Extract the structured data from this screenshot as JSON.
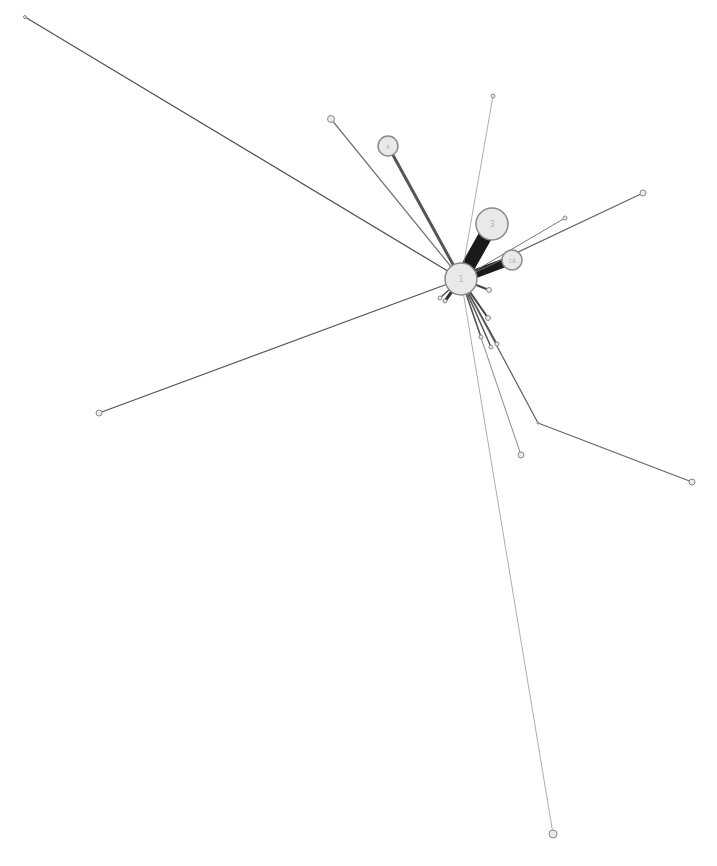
{
  "diagram": {
    "type": "network-graph",
    "background": "#ffffff",
    "node_fill": "#e9e9e9",
    "node_stroke": "#8a8a8a",
    "label_color": "#b5b5b5",
    "nodes": [
      {
        "id": "n1",
        "label": "1",
        "x": 461,
        "y": 279,
        "r": 16
      },
      {
        "id": "n3",
        "label": "3",
        "x": 492,
        "y": 224,
        "r": 16
      },
      {
        "id": "n4",
        "label": "4",
        "x": 388,
        "y": 146,
        "r": 10
      },
      {
        "id": "n18",
        "label": "18",
        "x": 512,
        "y": 260,
        "r": 10
      },
      {
        "id": "a",
        "label": "",
        "x": 25,
        "y": 17,
        "r": 1.5
      },
      {
        "id": "b",
        "label": "",
        "x": 331,
        "y": 119,
        "r": 3.5
      },
      {
        "id": "c",
        "label": "",
        "x": 493,
        "y": 96,
        "r": 2
      },
      {
        "id": "d",
        "label": "",
        "x": 643,
        "y": 193,
        "r": 3
      },
      {
        "id": "e",
        "label": "",
        "x": 565,
        "y": 218,
        "r": 2
      },
      {
        "id": "f",
        "label": "",
        "x": 99,
        "y": 413,
        "r": 3
      },
      {
        "id": "g",
        "label": "",
        "x": 538,
        "y": 423,
        "r": 1
      },
      {
        "id": "h",
        "label": "",
        "x": 692,
        "y": 482,
        "r": 3
      },
      {
        "id": "i",
        "label": "",
        "x": 521,
        "y": 455,
        "r": 3
      },
      {
        "id": "j",
        "label": "",
        "x": 553,
        "y": 834,
        "r": 4
      },
      {
        "id": "k",
        "label": "",
        "x": 445,
        "y": 301,
        "r": 2
      },
      {
        "id": "l",
        "label": "",
        "x": 440,
        "y": 298,
        "r": 2
      },
      {
        "id": "m",
        "label": "",
        "x": 489,
        "y": 290,
        "r": 2.5
      },
      {
        "id": "o",
        "label": "",
        "x": 488,
        "y": 318,
        "r": 2.5
      },
      {
        "id": "p",
        "label": "",
        "x": 481,
        "y": 337,
        "r": 2
      },
      {
        "id": "q",
        "label": "",
        "x": 491,
        "y": 347,
        "r": 2
      },
      {
        "id": "r",
        "label": "",
        "x": 497,
        "y": 344,
        "r": 2
      }
    ],
    "edges": [
      {
        "from": "n1",
        "to": "n3",
        "width": 14,
        "color": "#1a1a1a"
      },
      {
        "from": "n1",
        "to": "n18",
        "width": 9,
        "color": "#1a1a1a"
      },
      {
        "from": "n1",
        "to": "n4",
        "width": 3,
        "color": "#555555"
      },
      {
        "from": "n1",
        "to": "a",
        "width": 1.3,
        "color": "#555555"
      },
      {
        "from": "n1",
        "to": "b",
        "width": 1.3,
        "color": "#777777"
      },
      {
        "from": "n1",
        "to": "c",
        "width": 0.8,
        "color": "#999999"
      },
      {
        "from": "n1",
        "to": "d",
        "width": 1.3,
        "color": "#666666"
      },
      {
        "from": "n1",
        "to": "e",
        "width": 1,
        "color": "#777777"
      },
      {
        "from": "n1",
        "to": "f",
        "width": 1.3,
        "color": "#555555"
      },
      {
        "from": "n1",
        "to": "g",
        "width": 1.3,
        "color": "#666666"
      },
      {
        "from": "g",
        "to": "h",
        "width": 1.3,
        "color": "#666666"
      },
      {
        "from": "n1",
        "to": "i",
        "width": 1,
        "color": "#888888"
      },
      {
        "from": "n1",
        "to": "j",
        "width": 0.8,
        "color": "#999999"
      },
      {
        "from": "n1",
        "to": "k",
        "width": 3,
        "color": "#333333"
      },
      {
        "from": "n1",
        "to": "l",
        "width": 1.5,
        "color": "#555555"
      },
      {
        "from": "n1",
        "to": "m",
        "width": 2,
        "color": "#444444"
      },
      {
        "from": "n1",
        "to": "o",
        "width": 2,
        "color": "#444444"
      },
      {
        "from": "n1",
        "to": "p",
        "width": 1.5,
        "color": "#555555"
      },
      {
        "from": "n1",
        "to": "q",
        "width": 1.5,
        "color": "#555555"
      },
      {
        "from": "n1",
        "to": "r",
        "width": 1.5,
        "color": "#555555"
      }
    ]
  }
}
